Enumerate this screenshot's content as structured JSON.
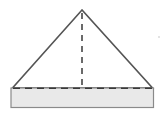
{
  "figure": {
    "name": "triangular-solid-with-height",
    "width": 165,
    "height": 115,
    "background_color": "#ffffff",
    "outline_color": "#555555",
    "dashed_color": "#3a3a3a",
    "base_fill_color": "#e9e9e9",
    "base_border_color": "#8a8a8a"
  },
  "chart_data": {
    "type": "diagram",
    "title": "",
    "shapes": [
      {
        "id": "triangle",
        "kind": "polygon",
        "label": "triangle-outline",
        "fill": "none",
        "stroke": "#555555",
        "stroke_width": 1.6,
        "points": [
          [
            82,
            10
          ],
          [
            12.5,
            88
          ],
          [
            152.5,
            88
          ]
        ]
      },
      {
        "id": "base-rectangle",
        "kind": "rect",
        "label": "base-rectangle",
        "fill": "#e9e9e9",
        "stroke": "#8a8a8a",
        "stroke_width": 1.2,
        "x": 11,
        "y": 88,
        "width": 142.5,
        "height": 19.5
      },
      {
        "id": "altitude",
        "kind": "dashed-line",
        "label": "dashed-altitude-line",
        "stroke": "#3a3a3a",
        "stroke_width": 1.5,
        "dash": [
          6,
          5
        ],
        "from": [
          82,
          12
        ],
        "to": [
          82,
          88
        ]
      },
      {
        "id": "hidden-base-edge",
        "kind": "dashed-line",
        "label": "dashed-base-edge",
        "stroke": "#3a3a3a",
        "stroke_width": 1.5,
        "dash": [
          7,
          5
        ],
        "from": [
          13,
          88
        ],
        "to": [
          152,
          88
        ]
      }
    ],
    "annotations": [],
    "legend": [],
    "grid": false
  }
}
